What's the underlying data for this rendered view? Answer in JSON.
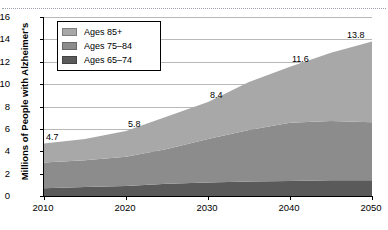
{
  "page": {
    "top_cut_text": "",
    "separator": "dotted-rule"
  },
  "chart_data": {
    "type": "area",
    "stacked": true,
    "title": "",
    "xlabel": "",
    "ylabel": "Millions of People with Alzheimer's",
    "xlim": [
      2010,
      2050
    ],
    "ylim": [
      0,
      16
    ],
    "ytick_step": 2,
    "grid": true,
    "legend_position": "top-left-inside",
    "x": [
      2010,
      2015,
      2020,
      2025,
      2030,
      2035,
      2040,
      2045,
      2050
    ],
    "xtick_labels": [
      "2010",
      "2020",
      "2030",
      "2040",
      "2050"
    ],
    "xticks": [
      2010,
      2020,
      2030,
      2040,
      2050
    ],
    "ytick_labels": [
      "0",
      "2",
      "4",
      "6",
      "8",
      "10",
      "12",
      "14",
      "16"
    ],
    "yticks": [
      0,
      2,
      4,
      6,
      8,
      10,
      12,
      14,
      16
    ],
    "series": [
      {
        "name": "Ages 65–74",
        "color": "#5a5a5a",
        "values": [
          0.7,
          0.8,
          0.9,
          1.1,
          1.2,
          1.3,
          1.35,
          1.4,
          1.4
        ]
      },
      {
        "name": "Ages 75–84",
        "color": "#8c8c8c",
        "values": [
          2.3,
          2.4,
          2.6,
          3.1,
          3.9,
          4.6,
          5.2,
          5.3,
          5.2
        ]
      },
      {
        "name": "Ages 85+",
        "color": "#a8a8a8",
        "values": [
          1.7,
          1.9,
          2.3,
          2.9,
          3.3,
          4.3,
          5.0,
          6.1,
          7.2
        ]
      }
    ],
    "totals": [
      4.7,
      5.1,
      5.8,
      7.1,
      8.4,
      10.2,
      11.6,
      12.8,
      13.8
    ],
    "annotations": [
      {
        "label": "4.7",
        "x": 2010,
        "y": 4.7
      },
      {
        "label": "5.8",
        "x": 2020,
        "y": 5.8
      },
      {
        "label": "8.4",
        "x": 2030,
        "y": 8.4
      },
      {
        "label": "11.6",
        "x": 2040,
        "y": 11.6
      },
      {
        "label": "13.8",
        "x": 2050,
        "y": 13.8
      }
    ]
  },
  "legend": {
    "items": [
      {
        "label": "Ages 85+",
        "color": "#a8a8a8"
      },
      {
        "label": "Ages 75–84",
        "color": "#8c8c8c"
      },
      {
        "label": "Ages 65–74",
        "color": "#5a5a5a"
      }
    ]
  }
}
